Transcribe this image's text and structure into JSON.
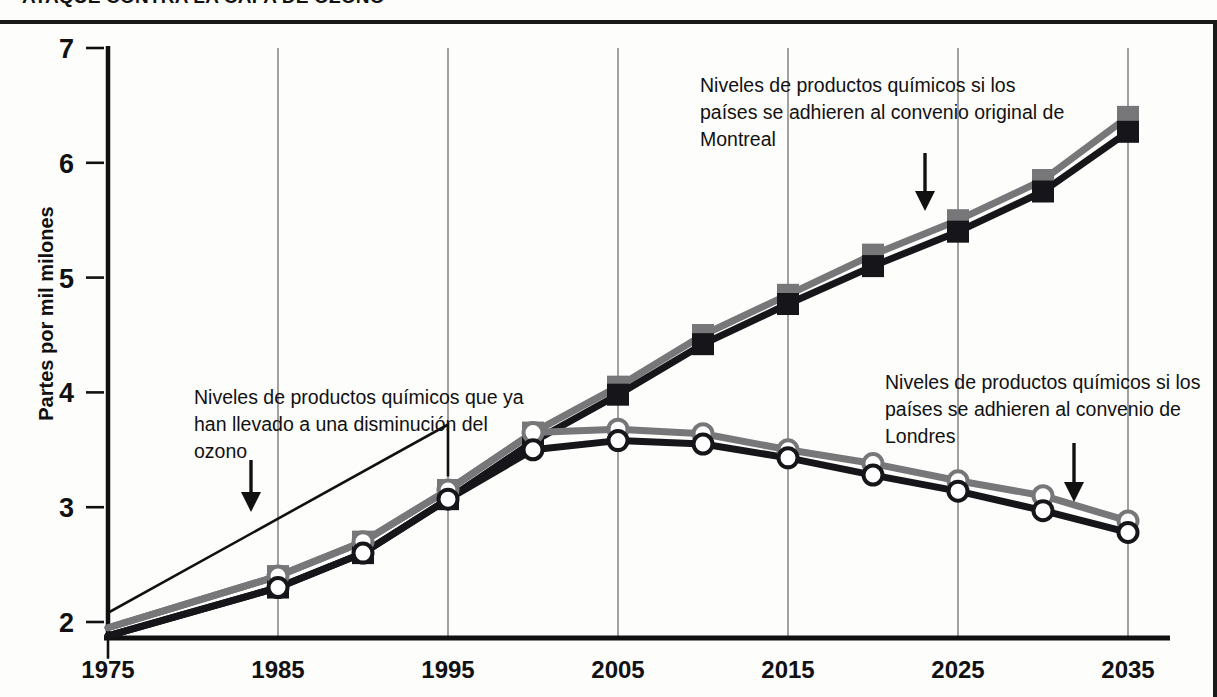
{
  "title": "ATAQUE CONTRA LA CAPA DE OZONO",
  "axis": {
    "ylabel": "Partes por mil milones",
    "yticks": [
      2,
      3,
      4,
      5,
      6,
      7
    ],
    "xticks": [
      1975,
      1985,
      1995,
      2005,
      2015,
      2025,
      2035
    ]
  },
  "annotations": {
    "ozone": "Niveles de productos químicos que ya han llevado a una disminución del ozono",
    "montreal": "Niveles de productos químicos si los países se adhieren al convenio original de Montreal",
    "londres": "Niveles de productos químicos si los países se adhieren al convenio de Londres"
  },
  "colors": {
    "line_gray": "#77777a",
    "line_black": "#16161a",
    "grid": "#8a8a8a",
    "axis": "#111111",
    "marker_fill": "#ffffff",
    "background": "#fdfdfc"
  },
  "chart_data": {
    "type": "line",
    "title": "ATAQUE CONTRA LA CAPA DE OZONO",
    "xlabel": "",
    "ylabel": "Partes por mil milones",
    "xlim": [
      1975,
      2035
    ],
    "ylim": [
      2,
      7
    ],
    "grid": "vertical",
    "legend": "none",
    "x": [
      1975,
      1985,
      1990,
      1995,
      2000,
      2005,
      2010,
      2015,
      2020,
      2025,
      2030,
      2035
    ],
    "series": [
      {
        "name": "Montreal (banda superior gris)",
        "marker": "square",
        "color": "#77777a",
        "values": [
          1.95,
          2.4,
          2.7,
          3.15,
          3.65,
          4.05,
          4.5,
          4.85,
          5.2,
          5.5,
          5.85,
          6.4
        ]
      },
      {
        "name": "Montreal (banda inferior negra)",
        "marker": "square",
        "color": "#16161a",
        "values": [
          1.88,
          2.3,
          2.6,
          3.07,
          3.57,
          3.98,
          4.42,
          4.77,
          5.1,
          5.4,
          5.75,
          6.27
        ]
      },
      {
        "name": "Londres (banda superior gris)",
        "marker": "circle",
        "color": "#77777a",
        "values": [
          1.95,
          2.4,
          2.7,
          3.15,
          3.65,
          3.68,
          3.64,
          3.5,
          3.38,
          3.23,
          3.1,
          2.88
        ]
      },
      {
        "name": "Londres (banda inferior negra)",
        "marker": "circle",
        "color": "#16161a",
        "values": [
          1.88,
          2.3,
          2.6,
          3.07,
          3.5,
          3.58,
          3.55,
          3.43,
          3.28,
          3.14,
          2.97,
          2.78
        ]
      }
    ],
    "bracket": {
      "from": 1975,
      "to": 1995,
      "label": "Niveles de productos químicos que ya han llevado a una disminución del ozono"
    }
  }
}
